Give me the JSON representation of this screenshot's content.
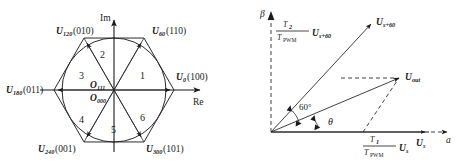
{
  "figure": {
    "background_color": "#ffffff",
    "line_color": "#2b2b2b",
    "text_color": "#1a1a1a"
  },
  "left_diagram": {
    "name": "space-vector-hexagon",
    "axes": {
      "imaginary_label": "Im",
      "real_label": "Re"
    },
    "origin_labels": [
      {
        "symbol": "O",
        "subscript": "111"
      },
      {
        "symbol": "O",
        "subscript": "000"
      }
    ],
    "vectors": [
      {
        "symbol": "U",
        "subscript": "0",
        "switching_state": "(100)",
        "angle_deg": 0,
        "label": "U0(100)"
      },
      {
        "symbol": "U",
        "subscript": "60",
        "switching_state": "(110)",
        "angle_deg": 60,
        "label": "U60(110)"
      },
      {
        "symbol": "U",
        "subscript": "120",
        "switching_state": "(010)",
        "angle_deg": 120,
        "label": "U120(010)"
      },
      {
        "symbol": "U",
        "subscript": "180",
        "switching_state": "(011)",
        "angle_deg": 180,
        "label": "U180(011)"
      },
      {
        "symbol": "U",
        "subscript": "240",
        "switching_state": "(001)",
        "angle_deg": 240,
        "label": "U240(001)"
      },
      {
        "symbol": "U",
        "subscript": "300",
        "switching_state": "(101)",
        "angle_deg": 300,
        "label": "U300(101)"
      }
    ],
    "sectors": [
      {
        "number": "1",
        "angle_deg": 30
      },
      {
        "number": "2",
        "angle_deg": 90
      },
      {
        "number": "3",
        "angle_deg": 150
      },
      {
        "number": "4",
        "angle_deg": 210
      },
      {
        "number": "5",
        "angle_deg": 270
      },
      {
        "number": "6",
        "angle_deg": 330
      }
    ]
  },
  "right_diagram": {
    "name": "vector-synthesis",
    "axes": {
      "alpha_label": "a",
      "beta_label": "β"
    },
    "angles": [
      {
        "label": "60°",
        "name": "sector-angle"
      },
      {
        "label": "θ",
        "name": "theta-angle"
      }
    ],
    "vectors": [
      {
        "name": "u-s-plus-60-vector",
        "symbol": "U",
        "subscript": "s+60",
        "label": "Us+60"
      },
      {
        "name": "u-out-vector",
        "symbol": "U",
        "subscript": "out",
        "label": "Uout"
      },
      {
        "name": "u-s-vector",
        "symbol": "U",
        "subscript": "s",
        "label": "Us"
      }
    ],
    "components": [
      {
        "name": "beta-component",
        "numerator": "T",
        "numerator_sub": "2",
        "denominator": "T",
        "denominator_sub": "PWM",
        "multiplier": "U",
        "multiplier_sub": "s+60",
        "label": "T2/TPWM Us+60"
      },
      {
        "name": "alpha-component",
        "numerator": "T",
        "numerator_sub": "1",
        "denominator": "T",
        "denominator_sub": "PWM",
        "multiplier": "U",
        "multiplier_sub": "s",
        "label": "T1/TPWM Us"
      }
    ]
  }
}
